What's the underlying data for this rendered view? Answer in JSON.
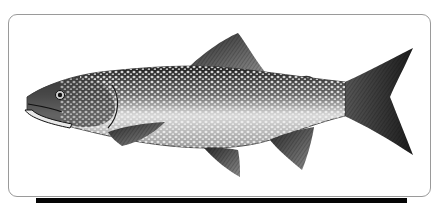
{
  "image": {
    "subject": "Lake trout illustration",
    "style": "monochrome stippled engraving",
    "colors": {
      "background": "#ffffff",
      "frame_border": "#9a9a9a",
      "bottom_bar": "#050505",
      "fish_dark": "#1e1e1e",
      "fish_mid": "#6b6b6b",
      "fish_light": "#e6e6e6",
      "spots": "#f2f2f2"
    }
  }
}
